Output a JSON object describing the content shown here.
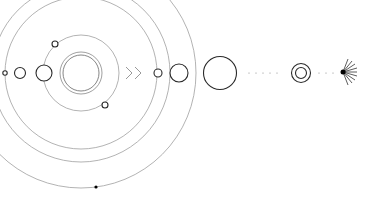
{
  "diagram": {
    "title": "",
    "colors": {
      "background": "#ffffff",
      "orbit": "#9a9a9a",
      "stroke": "#2a2a2a",
      "fill": "#000000"
    },
    "center": {
      "x": 81,
      "y": 73,
      "icon": "crescent-moon-icon"
    },
    "orbits": [
      38,
      76,
      89,
      115
    ],
    "left_bodies": [
      {
        "x": 5,
        "y": 73,
        "r": 2
      },
      {
        "x": 20,
        "y": 73,
        "r": 5
      },
      {
        "x": 44,
        "y": 73,
        "r": 8
      }
    ],
    "orbit_bodies": [
      {
        "x": 55,
        "y": 44,
        "r": 3
      },
      {
        "x": 105,
        "y": 105,
        "r": 3
      },
      {
        "x": 96,
        "y": 187,
        "r": 1.5,
        "filled": true
      }
    ],
    "arrows_icon": "double-chevron-right-icon",
    "right_bodies": [
      {
        "x": 158,
        "y": 73,
        "r": 4
      },
      {
        "x": 179,
        "y": 73,
        "r": 9
      },
      {
        "x": 220,
        "y": 73,
        "r": 16
      }
    ],
    "ringed_body": {
      "x": 300,
      "y": 73,
      "r_outer": 9,
      "r_inner": 5
    },
    "star": {
      "x": 345,
      "y": 72,
      "icon": "starburst-icon"
    }
  }
}
